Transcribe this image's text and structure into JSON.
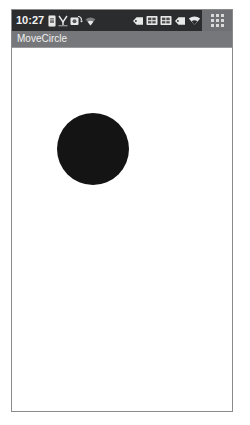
{
  "status_bar": {
    "clock": "10:27",
    "background_color": "#2b2c2e",
    "text_color": "#f2f2f2",
    "left_icons": [
      {
        "name": "sim-card-icon",
        "glyph": "sim"
      },
      {
        "name": "signal-bars-icon",
        "glyph": "signal"
      },
      {
        "name": "sync-icon",
        "glyph": "sync"
      },
      {
        "name": "wifi-weak-icon",
        "glyph": "wifi"
      }
    ],
    "right_icons": [
      {
        "name": "tag-icon",
        "glyph": "tag"
      },
      {
        "name": "battery-icon",
        "glyph": "battery"
      },
      {
        "name": "battery-secondary-icon",
        "glyph": "battery"
      },
      {
        "name": "tag-secondary-icon",
        "glyph": "tag"
      },
      {
        "name": "wifi-icon",
        "glyph": "wifi"
      },
      {
        "name": "shield-check-icon",
        "glyph": "shield"
      },
      {
        "name": "back-arrow-icon",
        "glyph": "back",
        "color": "#4caf50"
      }
    ],
    "app_grid_button": {
      "name": "app-grid-button",
      "dot_color": "#d9d9d9",
      "panel_color": "#6f7073"
    }
  },
  "title_bar": {
    "title": "MoveCircle",
    "background_color": "#76777a",
    "text_color": "#efefef"
  },
  "canvas": {
    "background_color": "#ffffff",
    "circle": {
      "name": "black-circle",
      "color": "#141414",
      "diameter": 72,
      "x": 45,
      "y": 65
    }
  }
}
